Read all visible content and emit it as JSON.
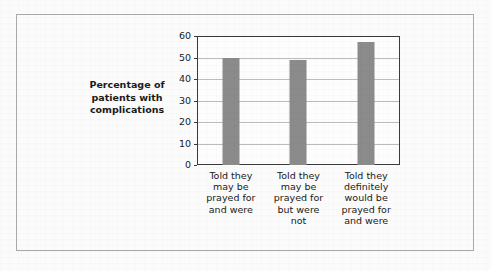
{
  "chart_data": {
    "type": "bar",
    "title": "",
    "xlabel": "",
    "ylabel": "Percentage of patients with complications",
    "ylabel_lines": [
      "Percentage of",
      "patients with",
      "complications"
    ],
    "categories": [
      "Told they may be prayed for and were",
      "Told they may be prayed for but were not",
      "Told they definitely would be prayed for and were"
    ],
    "category_lines": [
      [
        "Told they",
        "may be",
        "prayed for",
        "and were"
      ],
      [
        "Told they",
        "may be",
        "prayed for",
        "but were",
        "not"
      ],
      [
        "Told they",
        "definitely",
        "would be",
        "prayed for",
        "and were"
      ]
    ],
    "values": [
      50,
      49,
      57
    ],
    "ylim": [
      0,
      60
    ],
    "yticks": [
      0,
      10,
      20,
      30,
      40,
      50,
      60
    ],
    "grid": true,
    "legend": "none",
    "bar_color": "#8b8b8b",
    "axis_color": "#3a3a3a",
    "grid_color": "#bcbcbc",
    "frame_color": "#a9a9a9",
    "background_color": "#fbfbfb"
  }
}
